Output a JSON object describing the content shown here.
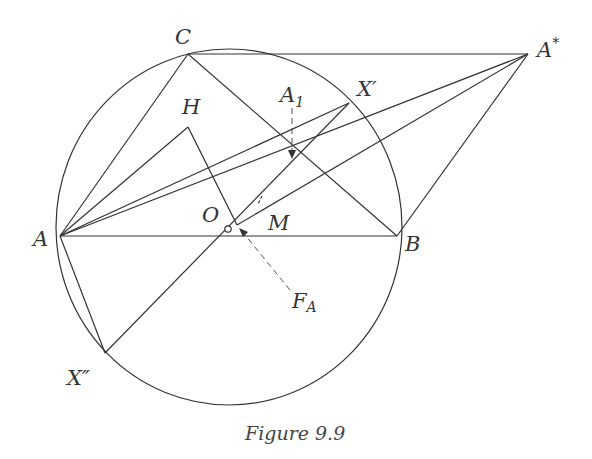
{
  "figure": {
    "caption": "Figure 9.9",
    "stroke_color": "#333333"
  },
  "labels": {
    "C": "C",
    "A_star": "A",
    "A_star_sup": "*",
    "H": "H",
    "A1": "A",
    "A1_sub": "1",
    "X_prime": "X′",
    "O": "O",
    "M": "M",
    "A": "A",
    "B": "B",
    "F_A": "F",
    "F_A_sub": "A",
    "X_double_prime": "X″"
  },
  "points": {
    "A": [
      60,
      236
    ],
    "B": [
      397,
      236
    ],
    "C": [
      188,
      54
    ],
    "A_star": [
      528,
      54
    ],
    "H": [
      188,
      127
    ],
    "O": [
      227,
      229
    ],
    "foot": [
      237,
      225
    ],
    "A1": [
      292,
      159
    ],
    "X_prime": [
      349,
      103
    ],
    "X_double_prime": [
      105,
      353
    ]
  },
  "circle": {
    "cx": 229,
    "cy": 227,
    "rx": 173,
    "ry": 178
  }
}
